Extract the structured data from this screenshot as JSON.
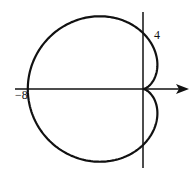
{
  "chart_data": {
    "type": "line",
    "title": "",
    "equation": "r = 4 - 4cos(θ)",
    "annotations": [
      {
        "text": "4",
        "at": [
          0,
          4
        ]
      },
      {
        "text": "-8",
        "at": [
          -8,
          0
        ]
      }
    ],
    "intercepts": {
      "x": [
        -8,
        0
      ],
      "y": [
        4,
        -4
      ]
    },
    "xlim": [
      -8.8,
      3.2
    ],
    "ylim": [
      -5.5,
      5.5
    ],
    "grid": false
  },
  "labels": {
    "y_intercept": "4",
    "x_intercept": "−8"
  }
}
